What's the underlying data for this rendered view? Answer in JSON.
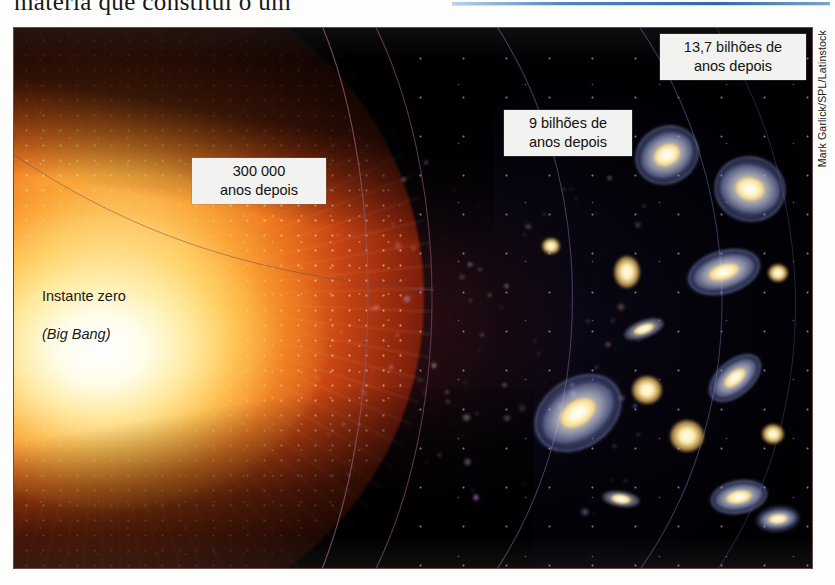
{
  "page": {
    "cutoff_text_line": "matéria que constituí o um"
  },
  "photo": {
    "credit": "Mark Garlick/SPL/Latinstock",
    "alt_description": "Ilustração da expansão do Universo desde o Big Bang até as galáxias atuais"
  },
  "labels": {
    "instante_zero": "Instante zero",
    "big_bang": "(Big Bang)",
    "epoch_300k": "300 000\nanos depois",
    "epoch_9b": "9 bilhões de\nanos depois",
    "epoch_137b": "13,7 bilhões de\nanos depois"
  },
  "colors": {
    "fireball_center": "#ffffff",
    "fireball_yellow": "#ffe28a",
    "fireball_orange": "#ee761e",
    "fireball_deep_red": "#8b240c",
    "space_black": "#010002",
    "callout_background": "#f2f2f0",
    "callout_text": "#111111",
    "arc_line": "#7a4a5e",
    "galaxy_core": "#fff7d2",
    "galaxy_halo": "#bec8ff",
    "blue_rule": "#2c6aa6"
  },
  "timeline": {
    "events": [
      {
        "id": "t0",
        "label": "Instante zero (Big Bang)",
        "time": "0"
      },
      {
        "id": "t300k",
        "label": "300 000 anos depois",
        "time": "300000 anos"
      },
      {
        "id": "t9b",
        "label": "9 bilhões de anos depois",
        "time": "9 bilhões de anos"
      },
      {
        "id": "t137b",
        "label": "13,7 bilhões de anos depois",
        "time": "13,7 bilhões de anos"
      }
    ]
  }
}
